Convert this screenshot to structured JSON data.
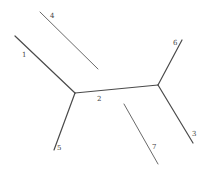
{
  "diagram": {
    "type": "unrooted-tree",
    "colors": {
      "edge": "#4a4a4a",
      "label": "#444444",
      "background": "#ffffff"
    },
    "nodes": [
      {
        "id": "n1",
        "x": 75,
        "y": 93
      },
      {
        "id": "n2",
        "x": 158,
        "y": 85
      }
    ],
    "edges": [
      {
        "id": "e1",
        "label": "1",
        "x1": 15,
        "y1": 36,
        "x2": 75,
        "y2": 93,
        "lx": 22,
        "ly": 57,
        "connected": true
      },
      {
        "id": "e2",
        "label": "2",
        "x1": 75,
        "y1": 93,
        "x2": 158,
        "y2": 85,
        "lx": 97,
        "ly": 101,
        "connected": true
      },
      {
        "id": "e3",
        "label": "3",
        "x1": 158,
        "y1": 85,
        "x2": 193,
        "y2": 143,
        "lx": 192,
        "ly": 136,
        "connected": true
      },
      {
        "id": "e4",
        "label": "4",
        "x1": 40,
        "y1": 12,
        "x2": 98,
        "y2": 69,
        "lx": 50,
        "ly": 18,
        "connected": false
      },
      {
        "id": "e5",
        "label": "5",
        "x1": 75,
        "y1": 93,
        "x2": 54,
        "y2": 150,
        "lx": 57,
        "ly": 150,
        "connected": true
      },
      {
        "id": "e6",
        "label": "6",
        "x1": 158,
        "y1": 85,
        "x2": 182,
        "y2": 40,
        "lx": 173,
        "ly": 45,
        "connected": true
      },
      {
        "id": "e7",
        "label": "7",
        "x1": 124,
        "y1": 104,
        "x2": 158,
        "y2": 164,
        "lx": 152,
        "ly": 149,
        "connected": false
      }
    ]
  }
}
